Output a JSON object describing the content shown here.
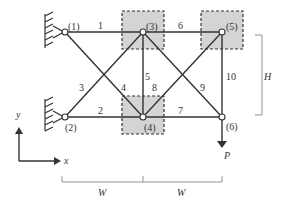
{
  "diagram": {
    "type": "truss",
    "nodes": [
      {
        "id": 1,
        "label": "(1)",
        "support": "fixed"
      },
      {
        "id": 2,
        "label": "(2)",
        "support": "fixed"
      },
      {
        "id": 3,
        "label": "(3)",
        "highlighted": true
      },
      {
        "id": 4,
        "label": "(4)",
        "highlighted": true
      },
      {
        "id": 5,
        "label": "(5)",
        "highlighted": true
      },
      {
        "id": 6,
        "label": "(6)"
      }
    ],
    "members": [
      {
        "label": "1",
        "from": 1,
        "to": 3
      },
      {
        "label": "2",
        "from": 2,
        "to": 4
      },
      {
        "label": "3",
        "from": 2,
        "to": 3
      },
      {
        "label": "4",
        "from": 1,
        "to": 4
      },
      {
        "label": "5",
        "from": 3,
        "to": 4
      },
      {
        "label": "6",
        "from": 3,
        "to": 5
      },
      {
        "label": "7",
        "from": 4,
        "to": 6
      },
      {
        "label": "8",
        "from": 4,
        "to": 5
      },
      {
        "label": "9",
        "from": 3,
        "to": 6
      },
      {
        "label": "10",
        "from": 5,
        "to": 6
      }
    ],
    "load": {
      "label": "P",
      "node": 6,
      "direction": "down"
    },
    "dimensions": {
      "height_label": "H",
      "width_labels": [
        "W",
        "W"
      ]
    },
    "axes": {
      "x_label": "x",
      "y_label": "y"
    },
    "colors": {
      "line": "#333333",
      "highlight_fill": "#d4d4d4",
      "dimension": "#888888"
    }
  }
}
